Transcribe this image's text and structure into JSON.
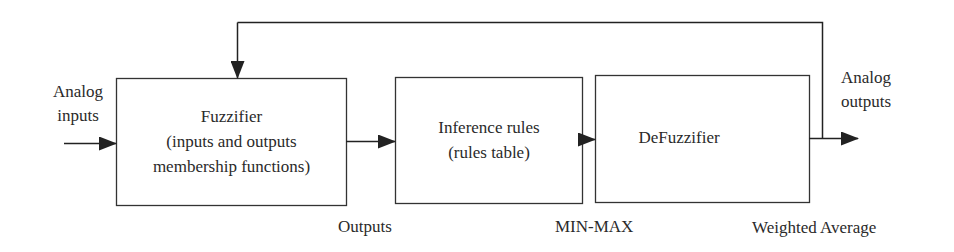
{
  "diagram": {
    "blocks": [
      {
        "id": "fuzzifier",
        "lines": [
          "Fuzzifier",
          "(inputs and outputs",
          "membership functions)"
        ]
      },
      {
        "id": "inference",
        "lines": [
          "Inference rules",
          "(rules table)"
        ]
      },
      {
        "id": "defuzzifier",
        "lines": [
          "DeFuzzifier"
        ]
      }
    ],
    "input_label": [
      "Analog",
      "inputs"
    ],
    "output_label": [
      "Analog",
      "outputs"
    ],
    "stage_labels": {
      "fuzzifier": "Outputs",
      "inference": "MIN-MAX",
      "defuzzifier": "Weighted Average"
    },
    "connections": [
      {
        "from": "analog-inputs",
        "to": "fuzzifier"
      },
      {
        "from": "fuzzifier",
        "to": "inference"
      },
      {
        "from": "inference",
        "to": "defuzzifier"
      },
      {
        "from": "defuzzifier",
        "to": "analog-outputs"
      },
      {
        "from": "defuzzifier-output",
        "to": "fuzzifier",
        "type": "feedback"
      }
    ],
    "stroke_color": "#2a2a2a"
  }
}
